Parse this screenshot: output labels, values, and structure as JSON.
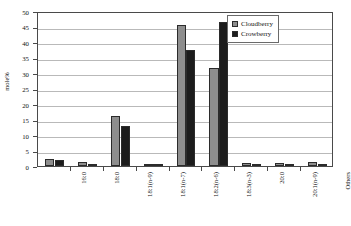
{
  "chart_data": {
    "type": "bar",
    "title": "",
    "xlabel": "",
    "ylabel": "mole%",
    "ylim": [
      0,
      50
    ],
    "ytick_step": 5,
    "yticks": [
      0,
      5,
      10,
      15,
      20,
      25,
      30,
      35,
      40,
      45,
      50
    ],
    "grid": true,
    "legend_position": "top-right",
    "categories": [
      "16:0",
      "18:0",
      "18:1(n-9)",
      "18:1(n-7)",
      "18:2(n-6)",
      "18:3(n-3)",
      "20:0",
      "20:1(n-9)",
      "Others"
    ],
    "series": [
      {
        "name": "Cloudberry",
        "color": "#8e8e8e",
        "values": [
          2.4,
          1.4,
          16.0,
          0.6,
          45.6,
          31.7,
          1.0,
          1.0,
          1.3
        ]
      },
      {
        "name": "Crowberry",
        "color": "#1c1c1c",
        "values": [
          2.1,
          0.5,
          13.0,
          0.6,
          37.3,
          46.5,
          0.2,
          0.2,
          0.5
        ]
      }
    ]
  }
}
